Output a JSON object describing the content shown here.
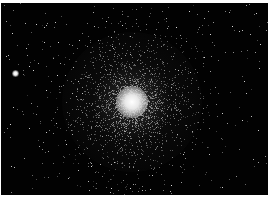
{
  "image": {
    "subject": "globular star cluster",
    "background_color": "#020202",
    "border_color": "#ffffff",
    "core": {
      "x": 131,
      "y": 99,
      "radius": 16,
      "color": "#f4f4f4"
    },
    "halo_radius": 70,
    "bright_star": {
      "x": 14,
      "y": 70
    }
  }
}
